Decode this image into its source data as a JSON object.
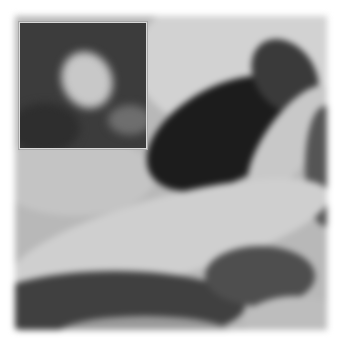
{
  "image": {
    "description": "Grayscale blurred microscopy-like image with a zoomed inset in the upper-left corner",
    "main": {
      "left": 15,
      "top": 16,
      "width": 312,
      "height": 314,
      "base_color": "#b8b8b8",
      "regions": [
        {
          "name": "top-light-band",
          "x": 130,
          "y": 0,
          "w": 190,
          "h": 120,
          "color": "#d0d0d0"
        },
        {
          "name": "dark-wedge",
          "x": 120,
          "y": 60,
          "w": 190,
          "h": 120,
          "color": "#1e1e1e"
        },
        {
          "name": "light-arc",
          "x": 0,
          "y": 170,
          "w": 320,
          "h": 90,
          "color": "#cfcfcf"
        },
        {
          "name": "bottom-dark-band",
          "x": 0,
          "y": 250,
          "w": 312,
          "h": 64,
          "color": "#4a4a4a"
        },
        {
          "name": "right-dark-patch",
          "x": 230,
          "y": 200,
          "w": 80,
          "h": 60,
          "color": "#555555"
        }
      ]
    },
    "inset": {
      "left": 19,
      "top": 22,
      "width": 126,
      "height": 125,
      "border_color": "#d8d8d8",
      "background": "#3c3c3c",
      "blobs": [
        {
          "name": "bright-blob",
          "x": 45,
          "y": 30,
          "w": 45,
          "h": 55,
          "color": "#cfcfcf"
        },
        {
          "name": "faint-blob",
          "x": 90,
          "y": 85,
          "w": 40,
          "h": 30,
          "color": "#7a7a7a"
        }
      ]
    }
  }
}
